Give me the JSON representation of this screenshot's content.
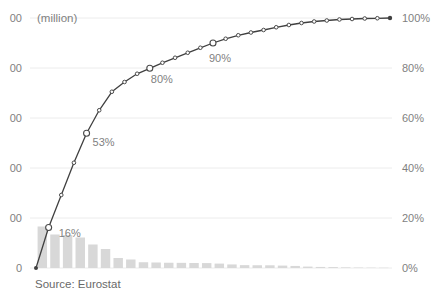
{
  "chart": {
    "axis_unit_label": "(million)",
    "source_note": "Source: Eurostat",
    "colors": {
      "bar": "#d8d8d8",
      "line": "#404040",
      "marker_stroke": "#4a4a4a",
      "marker_fill": "#ffffff",
      "gridline": "#ececec",
      "tick_text": "#7f7f7f",
      "annotation_text": "#7f7f7f",
      "source_text": "#696969",
      "background": "#ffffff"
    }
  },
  "chart_data": {
    "type": "bar",
    "subtype": "pareto-with-cumulative-line",
    "title": "",
    "xlabel": "",
    "ylabel_left_unit": "(million)",
    "x": [
      1,
      2,
      3,
      4,
      5,
      6,
      7,
      8,
      9,
      10,
      11,
      12,
      13,
      14,
      15,
      16,
      17,
      18,
      19,
      20,
      21,
      22,
      23,
      24,
      25,
      26,
      27,
      28
    ],
    "series": [
      {
        "name": "value_million",
        "type": "bar",
        "axis": "left",
        "values": [
          83,
          67,
          66,
          61,
          47,
          38,
          20,
          17,
          11.5,
          11,
          10.5,
          10.3,
          10,
          9.8,
          8.8,
          7.1,
          5.7,
          5.5,
          5.4,
          4.8,
          4.1,
          2.8,
          2.1,
          1.9,
          1.3,
          0.9,
          0.6,
          0.5
        ]
      },
      {
        "name": "cumulative_share_pct",
        "type": "line",
        "axis": "right",
        "starts_at_zero": true,
        "values": [
          16.2,
          29.2,
          42.1,
          53.9,
          63.1,
          70.5,
          74.4,
          77.7,
          79.9,
          82.1,
          84.1,
          86.1,
          88.1,
          90,
          91.7,
          93.1,
          94.2,
          95.2,
          96.3,
          97.2,
          98,
          98.6,
          99,
          99.4,
          99.6,
          99.8,
          99.9,
          100
        ]
      }
    ],
    "annotations": [
      {
        "point": 1,
        "label": "16%"
      },
      {
        "point": 4,
        "label": "53%"
      },
      {
        "point": 9,
        "label": "80%"
      },
      {
        "point": 14,
        "label": "90%"
      }
    ],
    "left_axis": {
      "tick_labels_visible": [
        "00",
        "00",
        "00",
        "00",
        "00",
        "0"
      ],
      "ylim": [
        0,
        500
      ],
      "note": "labels clipped at image edge"
    },
    "right_axis": {
      "tick_labels": [
        "100%",
        "80%",
        "60%",
        "40%",
        "20%",
        "0%"
      ],
      "ylim": [
        0,
        100
      ]
    },
    "grid": true,
    "legend": "none"
  }
}
